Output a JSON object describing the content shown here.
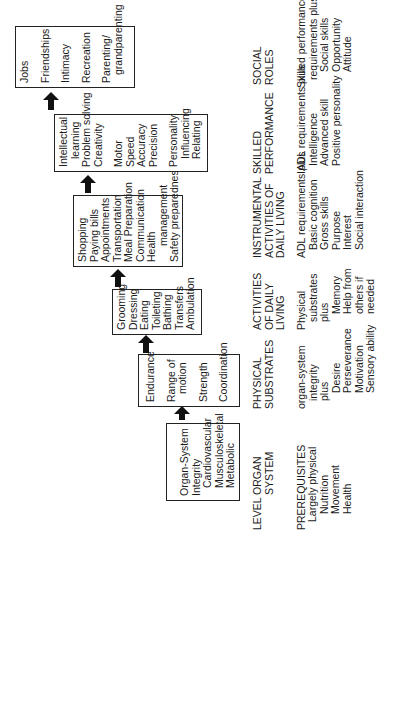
{
  "diagram": {
    "orientation": "rotated-90-ccw",
    "levels_label": "LEVEL",
    "prerequisites_label": "PREREQUISITES",
    "stages": [
      {
        "level": [
          "ORGAN",
          "SYSTEM"
        ],
        "box": [
          "Organ-System",
          "Integrity",
          "Cardiovascular",
          "Musculoskeletal",
          "Metabolic"
        ],
        "prerequisites": [
          "Largely physical",
          "Nutrition",
          "Movement",
          "Health"
        ]
      },
      {
        "level": [
          "PHYSICAL",
          "SUBSTRATES"
        ],
        "box": [
          "Endurance",
          "Range of",
          "motion",
          "Strength",
          "Coordination"
        ],
        "prerequisites": [
          "organ-system",
          "integrity",
          "plus",
          "Desire",
          "Perseverance",
          "Motivation",
          "Sensory ability"
        ]
      },
      {
        "level": [
          "ACTIVITIES",
          "OF DAILY",
          "LIVING"
        ],
        "box": [
          "Grooming",
          "Dressing",
          "Eating",
          "Toileting",
          "Bathing",
          "Transfers",
          "Ambulation"
        ],
        "prerequisites": [
          "Physical",
          "substrates",
          "plus",
          "Memory",
          "Help from",
          "others if",
          "needed"
        ]
      },
      {
        "level": [
          "INSTRUMENTAL",
          "ACTIVITIES OF",
          "DAILY LIVING"
        ],
        "box": [
          "Shopping",
          "Paying bills",
          "Appointments",
          "Transportation",
          "Meal Preparation",
          "Communication",
          "Health",
          "management",
          "Safety preparedness"
        ],
        "prerequisites": [
          "ADL requirements plus",
          "Basic cognition",
          "Gross skills",
          "Purpose",
          "Interest",
          "Social interaction"
        ]
      },
      {
        "level": [
          "SKILLED",
          "PERFORMANCE"
        ],
        "box": [
          "Intellectual",
          "learning",
          "Problem solving",
          "Creativity",
          "Motor",
          "Speed",
          "Accuracy",
          "Precision",
          "Personality",
          "Influencing",
          "Relating"
        ],
        "prerequisites": [
          "IADL requirements plus",
          "Intelligence",
          "Advanced skill",
          "Positive personality"
        ]
      },
      {
        "level": [
          "SOCIAL",
          "ROLES"
        ],
        "box": [
          "Jobs",
          "Friendships",
          "Intimacy",
          "Recreation",
          "Parenting/",
          "grandparenting"
        ],
        "prerequisites": [
          "Skilled performance",
          "requirements plus",
          "Social skills",
          "Opportunity",
          "Attitude"
        ]
      }
    ],
    "colors": {
      "ink": "#1a1a1a",
      "background": "#ffffff"
    }
  }
}
